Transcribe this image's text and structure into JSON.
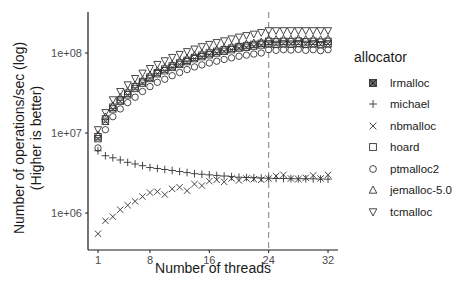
{
  "chart_data": {
    "type": "scatter",
    "title": "",
    "xlabel": "Number of threads",
    "ylabel": "Number of operations/sec (log)\n(Higher is better)",
    "ylabel_lines": [
      "Number of operations/sec (log)",
      "(Higher is better)"
    ],
    "y_scale": "log10",
    "ylim": [
      450000,
      300000000
    ],
    "xlim": [
      0,
      33
    ],
    "x_ticks": [
      1,
      8,
      16,
      24,
      32
    ],
    "x_tick_labels": [
      "1",
      "8",
      "16",
      "24",
      "32"
    ],
    "y_ticks": [
      1000000,
      10000000,
      100000000
    ],
    "y_tick_labels": [
      "1e+06",
      "1e+07",
      "1e+08"
    ],
    "grid": false,
    "reference_line": {
      "axis": "x",
      "value": 24,
      "style": "dashed",
      "color": "#808080"
    },
    "legend": {
      "title": "allocator",
      "position": "right"
    },
    "x": [
      1,
      2,
      3,
      4,
      5,
      6,
      7,
      8,
      9,
      10,
      11,
      12,
      13,
      14,
      15,
      16,
      17,
      18,
      19,
      20,
      21,
      22,
      23,
      24,
      25,
      26,
      27,
      28,
      29,
      30,
      31,
      32
    ],
    "series": [
      {
        "name": "lrmalloc",
        "marker": "square-x",
        "values": [
          8500000,
          14000000,
          20000000,
          25000000,
          30000000,
          36000000,
          42000000,
          48000000,
          55000000,
          60000000,
          66000000,
          72000000,
          78000000,
          85000000,
          90000000,
          95000000,
          100000000,
          105000000,
          110000000,
          115000000,
          118000000,
          122000000,
          126000000,
          130000000,
          128000000,
          130000000,
          129000000,
          131000000,
          128000000,
          130000000,
          127000000,
          130000000
        ]
      },
      {
        "name": "michael",
        "marker": "plus",
        "values": [
          6000000,
          5200000,
          4900000,
          4600000,
          4300000,
          4100000,
          3900000,
          3700000,
          3600000,
          3500000,
          3400000,
          3300000,
          3200000,
          3100000,
          3050000,
          3000000,
          2950000,
          2900000,
          2850000,
          2800000,
          2780000,
          2760000,
          2740000,
          2720000,
          2700000,
          2700000,
          2690000,
          2680000,
          2680000,
          2670000,
          2660000,
          2650000
        ]
      },
      {
        "name": "nbmalloc",
        "marker": "x",
        "values": [
          550000,
          800000,
          900000,
          1100000,
          1250000,
          1400000,
          1600000,
          1800000,
          1850000,
          1700000,
          2000000,
          2100000,
          1900000,
          2300000,
          2200000,
          2500000,
          2600000,
          2450000,
          2700000,
          2550000,
          2700000,
          2650000,
          2600000,
          2700000,
          2900000,
          3000000,
          2700000,
          2650000,
          2750000,
          2950000,
          2700000,
          3000000
        ]
      },
      {
        "name": "hoard",
        "marker": "square",
        "values": [
          9000000,
          15000000,
          21000000,
          26000000,
          31500000,
          38000000,
          44000000,
          50000000,
          57000000,
          63000000,
          69000000,
          75000000,
          81000000,
          88000000,
          94000000,
          100000000,
          105000000,
          110000000,
          115000000,
          120000000,
          124000000,
          128000000,
          132000000,
          140000000,
          138000000,
          140000000,
          139000000,
          141000000,
          138000000,
          140000000,
          137000000,
          140000000
        ]
      },
      {
        "name": "ptmalloc2",
        "marker": "circle",
        "values": [
          6500000,
          11000000,
          16000000,
          20000000,
          24000000,
          28000000,
          33000000,
          38000000,
          43000000,
          47000000,
          52000000,
          57000000,
          62000000,
          67000000,
          71000000,
          75000000,
          79000000,
          83000000,
          87000000,
          91000000,
          94000000,
          97000000,
          100000000,
          110000000,
          108000000,
          110000000,
          109000000,
          111000000,
          108000000,
          110000000,
          107000000,
          110000000
        ]
      },
      {
        "name": "jemalloc-5.0",
        "marker": "triangle-up",
        "values": [
          9500000,
          16000000,
          22000000,
          28000000,
          33000000,
          40000000,
          46000000,
          53000000,
          60000000,
          66000000,
          72000000,
          79000000,
          86000000,
          93000000,
          99000000,
          105000000,
          110000000,
          116000000,
          121000000,
          126000000,
          130000000,
          134000000,
          138000000,
          150000000,
          148000000,
          150000000,
          149000000,
          151000000,
          148000000,
          150000000,
          147000000,
          150000000
        ]
      },
      {
        "name": "tcmalloc",
        "marker": "triangle-down",
        "values": [
          11000000,
          18000000,
          26000000,
          33000000,
          40000000,
          48000000,
          56000000,
          64000000,
          72000000,
          80000000,
          88000000,
          96000000,
          104000000,
          112000000,
          120000000,
          128000000,
          135000000,
          142000000,
          150000000,
          158000000,
          165000000,
          172000000,
          180000000,
          190000000,
          190000000,
          190000000,
          190000000,
          190000000,
          190000000,
          190000000,
          190000000,
          190000000
        ]
      }
    ]
  }
}
